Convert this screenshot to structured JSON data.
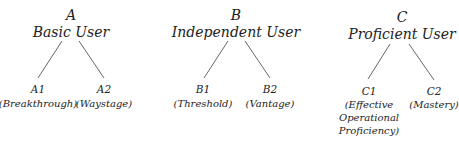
{
  "groups": [
    {
      "level": "A",
      "title": "Basic User",
      "children": [
        {
          "level": "A1",
          "description": "(Breakthrough)"
        },
        {
          "level": "A2",
          "description": "(Waystage)"
        }
      ]
    },
    {
      "level": "B",
      "title": "Independent User",
      "children": [
        {
          "level": "B1",
          "description": "(Threshold)"
        },
        {
          "level": "B2",
          "description": "(Vantage)"
        }
      ]
    },
    {
      "level": "C",
      "title": "Proficient User",
      "children": [
        {
          "level": "C1",
          "description_lines": [
            "(Effective",
            "Operational",
            "Proficiency)"
          ]
        },
        {
          "level": "C2",
          "description": "(Mastery)"
        }
      ]
    }
  ],
  "line_color": "#555555"
}
